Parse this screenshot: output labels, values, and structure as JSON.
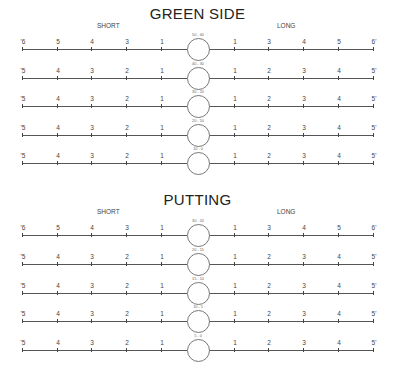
{
  "sections": [
    {
      "title": "GREEN SIDE",
      "short_label": "SHORT",
      "long_label": "LONG",
      "rows": [
        {
          "range": "50 - 40",
          "left": [
            "'6",
            "5",
            "4",
            "3",
            "1"
          ],
          "right": [
            "1",
            "3",
            "4",
            "5",
            "6'"
          ]
        },
        {
          "range": "40 - 30",
          "left": [
            "'5",
            "4",
            "3",
            "2",
            "1"
          ],
          "right": [
            "1",
            "2",
            "3",
            "4",
            "5'"
          ]
        },
        {
          "range": "30 - 20",
          "left": [
            "'5",
            "4",
            "3",
            "2",
            "1"
          ],
          "right": [
            "1",
            "2",
            "3",
            "4",
            "5'"
          ]
        },
        {
          "range": "20 - 10",
          "left": [
            "'5",
            "4",
            "3",
            "2",
            "1"
          ],
          "right": [
            "1",
            "2",
            "3",
            "4",
            "5'"
          ]
        },
        {
          "range": "10 - 0",
          "left": [
            "'5",
            "4",
            "3",
            "2",
            "1"
          ],
          "right": [
            "1",
            "2",
            "3",
            "4",
            "5'"
          ]
        }
      ]
    },
    {
      "title": "PUTTING",
      "short_label": "SHORT",
      "long_label": "LONG",
      "rows": [
        {
          "range": "30 - 20",
          "left": [
            "'6",
            "5",
            "4",
            "3",
            "1"
          ],
          "right": [
            "1",
            "3",
            "4",
            "5",
            "6'"
          ]
        },
        {
          "range": "20 - 15",
          "left": [
            "'5",
            "4",
            "3",
            "2",
            "1"
          ],
          "right": [
            "1",
            "2",
            "3",
            "4",
            "5'"
          ]
        },
        {
          "range": "15 - 10",
          "left": [
            "'5",
            "4",
            "3",
            "2",
            "1"
          ],
          "right": [
            "1",
            "2",
            "3",
            "4",
            "5'"
          ]
        },
        {
          "range": "10 - 5",
          "left": [
            "'5",
            "4",
            "3",
            "2",
            "1"
          ],
          "right": [
            "1",
            "2",
            "3",
            "4",
            "5'"
          ]
        },
        {
          "range": "5 - 0",
          "left": [
            "'5",
            "4",
            "3",
            "2",
            "1"
          ],
          "right": [
            "1",
            "2",
            "3",
            "4",
            "5'"
          ]
        }
      ]
    }
  ]
}
